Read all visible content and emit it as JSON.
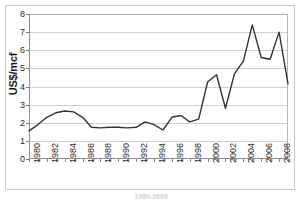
{
  "chart_data": {
    "type": "line",
    "title": "",
    "xlabel": "",
    "ylabel": "US$/mcf",
    "xlim": [
      1980,
      2009
    ],
    "ylim": [
      0,
      8
    ],
    "grid": true,
    "legend": false,
    "line_color": "#333333",
    "x": [
      1980,
      1981,
      1982,
      1983,
      1984,
      1985,
      1986,
      1987,
      1988,
      1989,
      1990,
      1991,
      1992,
      1993,
      1994,
      1995,
      1996,
      1997,
      1998,
      1999,
      2000,
      2001,
      2002,
      2003,
      2004,
      2005,
      2006,
      2007,
      2008,
      2009
    ],
    "values": [
      1.55,
      1.9,
      2.3,
      2.55,
      2.65,
      2.6,
      2.3,
      1.75,
      1.72,
      1.75,
      1.75,
      1.72,
      1.75,
      2.05,
      1.9,
      1.6,
      2.3,
      2.4,
      2.05,
      2.2,
      4.25,
      4.65,
      2.8,
      4.7,
      5.4,
      7.4,
      5.6,
      5.5,
      7.0,
      4.15
    ],
    "yticks": [
      0,
      1,
      2,
      3,
      4,
      5,
      6,
      7,
      8
    ],
    "ytick_labels": [
      "0",
      "1",
      "2",
      "3",
      "4",
      "5",
      "6",
      "7",
      "8"
    ],
    "xticks": [
      1980,
      1981,
      1982,
      1983,
      1984,
      1985,
      1986,
      1987,
      1988,
      1989,
      1990,
      1991,
      1992,
      1993,
      1994,
      1995,
      1996,
      1997,
      1998,
      1999,
      2000,
      2001,
      2002,
      2003,
      2004,
      2005,
      2006,
      2007,
      2008,
      2009
    ],
    "xtick_labels_shown": [
      "1980",
      "1982",
      "1984",
      "1986",
      "1988",
      "1990",
      "1992",
      "1994",
      "1996",
      "1998",
      "2000",
      "2002",
      "2004",
      "2006",
      "2008"
    ]
  },
  "caption": {
    "text": "1980-2009"
  }
}
